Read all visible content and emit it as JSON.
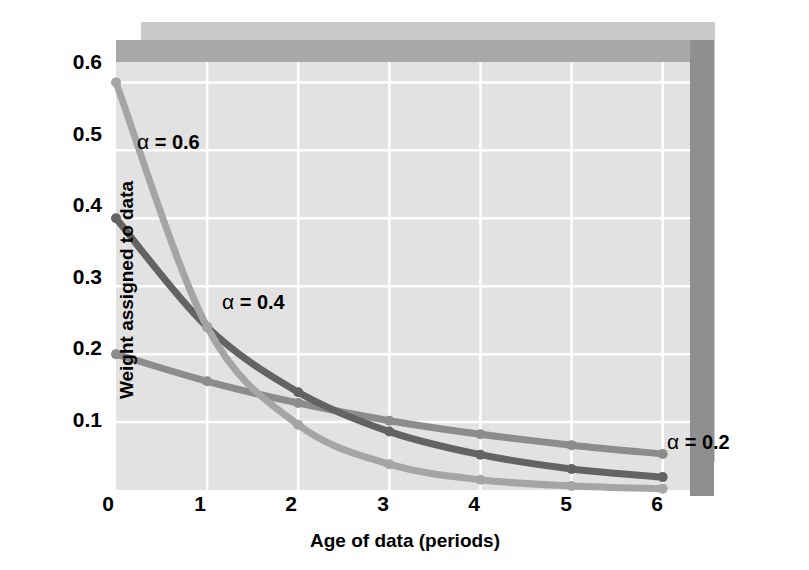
{
  "chart_data": {
    "type": "line",
    "title": "",
    "xlabel": "Age of data (periods)",
    "ylabel": "Weight assigned to data",
    "x": [
      0,
      1,
      2,
      3,
      4,
      5,
      6
    ],
    "xlim": [
      0,
      6.3
    ],
    "ylim": [
      0,
      0.63
    ],
    "xticks": [
      "0",
      "1",
      "2",
      "3",
      "4",
      "5",
      "6"
    ],
    "yticks": [
      "0.1",
      "0.2",
      "0.3",
      "0.4",
      "0.5",
      "0.6"
    ],
    "ytick_values": [
      0.1,
      0.2,
      0.3,
      0.4,
      0.5,
      0.6
    ],
    "grid": "both",
    "grid_color": "#ffffff",
    "plot_background": "#e2e2e2",
    "legend_position": "inline-annotations",
    "series": [
      {
        "name": "alpha = 0.2",
        "label": "α = 0.2",
        "color": "#8c8c8c",
        "values": [
          0.2,
          0.16,
          0.128,
          0.102,
          0.082,
          0.066,
          0.053
        ]
      },
      {
        "name": "alpha = 0.4",
        "label": "α = 0.4",
        "color": "#636363",
        "values": [
          0.4,
          0.24,
          0.144,
          0.086,
          0.052,
          0.031,
          0.019
        ]
      },
      {
        "name": "alpha = 0.6",
        "label": "α = 0.6",
        "color": "#a5a5a5",
        "values": [
          0.6,
          0.24,
          0.096,
          0.038,
          0.015,
          0.006,
          0.002
        ]
      }
    ],
    "annotations": [
      {
        "text": "α = 0.6",
        "symbol": "α",
        "rest": " = 0.6"
      },
      {
        "text": "α = 0.4",
        "symbol": "α",
        "rest": " = 0.4"
      },
      {
        "text": "α = 0.2",
        "symbol": "α",
        "rest": " = 0.2"
      }
    ]
  },
  "axes": {
    "x_title": "Age of data (periods)",
    "y_title": "Weight assigned to data",
    "x_tick_labels": [
      "0",
      "1",
      "2",
      "3",
      "4",
      "5",
      "6"
    ],
    "y_tick_labels": [
      "0.6",
      "0.5",
      "0.4",
      "0.3",
      "0.2",
      "0.1"
    ]
  },
  "annotations": {
    "alpha06_symbol": "α",
    "alpha06_rest": " = 0.6",
    "alpha04_symbol": "α",
    "alpha04_rest": " = 0.4",
    "alpha02_symbol": "α",
    "alpha02_rest": " = 0.2"
  },
  "colors": {
    "plot_bg": "#e2e2e2",
    "grid": "#ffffff",
    "bevel_top": "#a8a8a8",
    "bevel_right": "#8f8f8f",
    "drop_shadow": "#c9c9c9",
    "series_alpha02": "#8c8c8c",
    "series_alpha04": "#636363",
    "series_alpha06": "#a5a5a5"
  }
}
